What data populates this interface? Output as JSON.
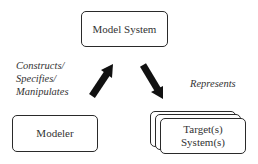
{
  "diagram": {
    "nodes": {
      "model_system": {
        "label": "Model System"
      },
      "modeler": {
        "label": "Modeler"
      },
      "targets": {
        "line1": "Target(s)",
        "line2": "System(s)"
      }
    },
    "edges": {
      "modeler_to_model": {
        "label_line1": "Constructs/",
        "label_line2": "Specifies/",
        "label_line3": "Manipulates"
      },
      "model_to_targets": {
        "label": "Represents"
      }
    }
  }
}
